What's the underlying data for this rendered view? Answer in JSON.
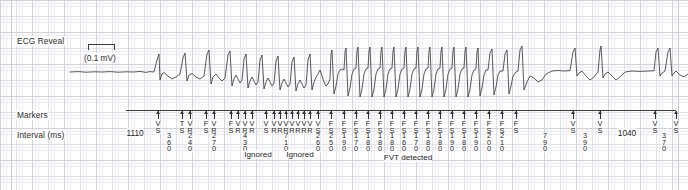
{
  "strip": {
    "rows": {
      "ecg_label": "ECG Reveal",
      "markers_label": "Markers",
      "interval_label": "Interval (ms)"
    },
    "calibration": {
      "text": "(0.1  mV)",
      "amplitude": "0.1 mV"
    },
    "colors": {
      "trace": "#3c3c3c",
      "grid_fine": "#ececf2",
      "grid_bold": "#d2d2dd",
      "text": "#1d1d1d"
    }
  },
  "annotations": {
    "notes": [
      {
        "text": "Ignored",
        "x": 258,
        "y": 150
      },
      {
        "text": "Ignored",
        "x": 300,
        "y": 150
      },
      {
        "text": "FVT detected",
        "x": 408,
        "y": 153
      }
    ]
  },
  "events": [
    {
      "x": 135,
      "tick": false,
      "code": "",
      "interval": "1110",
      "horizontal": true
    },
    {
      "x": 158,
      "tick": true,
      "code": "VS",
      "interval": ""
    },
    {
      "x": 169,
      "tick": false,
      "code": "",
      "interval": "360"
    },
    {
      "x": 182,
      "tick": true,
      "code": "TS",
      "interval": ""
    },
    {
      "x": 190,
      "tick": true,
      "code": "VR",
      "interval": "240"
    },
    {
      "x": 206,
      "tick": true,
      "code": "FS",
      "interval": ""
    },
    {
      "x": 214,
      "tick": true,
      "code": "VR",
      "interval": "270"
    },
    {
      "x": 231,
      "tick": true,
      "code": "FS",
      "interval": ""
    },
    {
      "x": 238,
      "tick": true,
      "code": "VR",
      "interval": ""
    },
    {
      "x": 245,
      "tick": true,
      "code": "VR",
      "interval": "430"
    },
    {
      "x": 252,
      "tick": true,
      "code": "VR",
      "interval": ""
    },
    {
      "x": 266,
      "tick": true,
      "code": "VS",
      "interval": ""
    },
    {
      "x": 274,
      "tick": true,
      "code": "VR",
      "interval": ""
    },
    {
      "x": 280,
      "tick": true,
      "code": "VR",
      "interval": ""
    },
    {
      "x": 286,
      "tick": true,
      "code": "VR",
      "interval": "710"
    },
    {
      "x": 292,
      "tick": true,
      "code": "VR",
      "interval": ""
    },
    {
      "x": 298,
      "tick": true,
      "code": "VR",
      "interval": ""
    },
    {
      "x": 304,
      "tick": true,
      "code": "VR",
      "interval": ""
    },
    {
      "x": 310,
      "tick": true,
      "code": "VR",
      "interval": ""
    },
    {
      "x": 318,
      "tick": true,
      "code": "VS",
      "interval": "260"
    },
    {
      "x": 331,
      "tick": true,
      "code": "FS",
      "interval": "250"
    },
    {
      "x": 344,
      "tick": true,
      "code": "FS",
      "interval": "190"
    },
    {
      "x": 356,
      "tick": true,
      "code": "FS",
      "interval": "170"
    },
    {
      "x": 368,
      "tick": true,
      "code": "FS",
      "interval": "180"
    },
    {
      "x": 380,
      "tick": true,
      "code": "FS",
      "interval": "180"
    },
    {
      "x": 392,
      "tick": true,
      "code": "FS",
      "interval": "180"
    },
    {
      "x": 404,
      "tick": true,
      "code": "FS",
      "interval": "160"
    },
    {
      "x": 416,
      "tick": true,
      "code": "FS",
      "interval": "170"
    },
    {
      "x": 428,
      "tick": true,
      "code": "FS",
      "interval": "180"
    },
    {
      "x": 440,
      "tick": true,
      "code": "FS",
      "interval": "180"
    },
    {
      "x": 452,
      "tick": true,
      "code": "FS",
      "interval": "190"
    },
    {
      "x": 464,
      "tick": true,
      "code": "FS",
      "interval": "180"
    },
    {
      "x": 476,
      "tick": true,
      "code": "FS",
      "interval": "190"
    },
    {
      "x": 489,
      "tick": true,
      "code": "FS",
      "interval": "200"
    },
    {
      "x": 502,
      "tick": true,
      "code": "FS",
      "interval": "210"
    },
    {
      "x": 516,
      "tick": true,
      "code": "FS",
      "interval": ""
    },
    {
      "x": 545,
      "tick": false,
      "code": "",
      "interval": "790"
    },
    {
      "x": 573,
      "tick": true,
      "code": "VS",
      "interval": ""
    },
    {
      "x": 585,
      "tick": false,
      "code": "",
      "interval": "390"
    },
    {
      "x": 600,
      "tick": true,
      "code": "VS",
      "interval": ""
    },
    {
      "x": 627,
      "tick": false,
      "code": "",
      "interval": "1040",
      "horizontal": true
    },
    {
      "x": 655,
      "tick": true,
      "code": "VS",
      "interval": ""
    },
    {
      "x": 664,
      "tick": false,
      "code": "",
      "interval": "370"
    },
    {
      "x": 676,
      "tick": true,
      "code": "VS",
      "interval": ""
    }
  ],
  "waveform": {
    "path": "M 70 48 L 78 47.6 L 86 48.2 L 94 47.8 L 102 48 L 110 47.6 L 118 48.2 L 126 47.8 L 134 48 L 140 47.4 L 146 48.4 L 150 47.6 L 154 48 L 157 36 L 159 30 L 160 56 L 162 50 L 164 48.6 L 168 52 L 172 55 L 176 53 L 180 50 L 183 34 L 185 29 L 187 57 L 189 51 L 192 49.5 L 196 53 L 200 55 L 204 52 L 207 30 L 209 26 L 211 60 L 213 53 L 216 50 L 219 54 L 222 57 L 225 54 L 228 31 L 230 27 L 232 62 L 234 55 L 236 51 L 238 55 L 240 59 L 242 56 L 244 35 L 246 30 L 248 64 L 250 57 L 252 53 L 254 57 L 256 61 L 258 58 L 260 36 L 262 31 L 264 65 L 266 58 L 268 54 L 270 58 L 272 62 L 274 59 L 276 37 L 278 32 L 280 66 L 282 59 L 284 55 L 286 59 L 288 63 L 290 60 L 292 38 L 294 33 L 296 67 L 298 60 L 300 56 L 302 60 L 304 64 L 306 61 L 308 36 L 310 30 L 312 66 L 314 58 L 316 53 L 318 50 L 320 46 L 322 52 L 324 58 L 326 62 L 328 60 L 330 55 L 331 30 L 332 26 L 334 70 L 336 62 L 338 50 L 340 46 L 342 45 L 344 46 L 345 28 L 346 24 L 348 72 L 350 64 L 352 50 L 354 45 L 356 44 L 357 27 L 358 23 L 360 73 L 362 65 L 364 50 L 366 45 L 368 44 L 369 27 L 370 23 L 372 73 L 374 65 L 376 50 L 378 45 L 380 44 L 381 27 L 382 23 L 384 73 L 386 65 L 388 50 L 390 45 L 392 44 L 393 27 L 394 23 L 396 73 L 398 65 L 400 50 L 402 45 L 404 44 L 405 27 L 406 23 L 408 73 L 410 65 L 412 50 L 414 45 L 416 44 L 417 27 L 418 23 L 420 73 L 422 65 L 424 50 L 426 45 L 428 44 L 429 27 L 430 23 L 432 73 L 434 65 L 436 50 L 438 45 L 440 44 L 441 27 L 442 23 L 444 73 L 446 65 L 448 50 L 450 45 L 452 44 L 453 27 L 454 23 L 456 73 L 458 65 L 460 50 L 462 45 L 464 44 L 465 27 L 466 23 L 468 73 L 470 65 L 472 51 L 474 46 L 476 45 L 477 28 L 478 24 L 480 72 L 482 64 L 484 51 L 486 46 L 488 46 L 490 29 L 492 25 L 494 71 L 496 63 L 498 51 L 500 47 L 503 47 L 505 30 L 507 26 L 509 70 L 511 62 L 513 52 L 516 48 L 518 47 L 520 26 L 522 22 L 524 66 L 527 58 L 530 52 L 534 54 L 538 58 L 542 56 L 546 50 L 552 47 L 558 46.5 L 564 47 L 570 46.6 L 573 28 L 575 24 L 577 52 L 579 49 L 582 47 L 586 52 L 590 56 L 594 53 L 598 48 L 600 26 L 601 22 L 603 54 L 605 50 L 608 48 L 612 52 L 616 56 L 620 53 L 625 48 L 632 47 L 640 47.4 L 648 47 L 654 46.8 L 656 28 L 658 24 L 660 52 L 662 49 L 665 47 L 668 28 L 670 24 L 672 52 L 674 49 L 676 47 L 680 51 L 684 53 L 688 50"
  }
}
